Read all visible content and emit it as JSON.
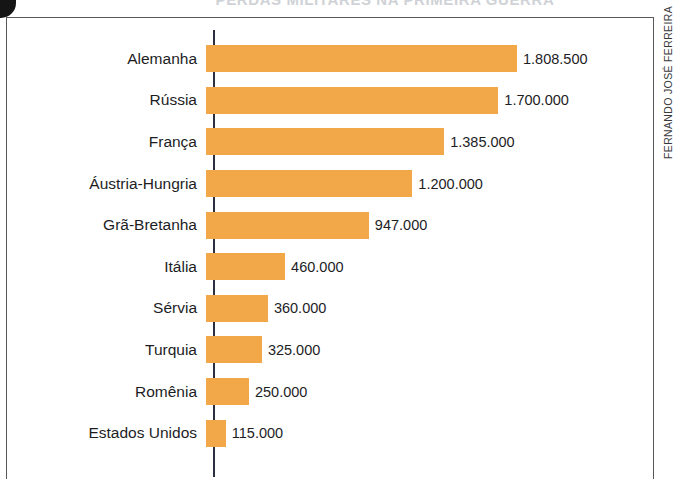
{
  "decorations": {
    "corner_blob": "black-corner-mark",
    "title_sliver": "PERDAS MILITARES NA PRIMEIRA GUERRA",
    "credit": "FERNANDO JOSÉ FERREIRA"
  },
  "chart_data": {
    "type": "bar",
    "orientation": "horizontal",
    "title": "",
    "xlabel": "",
    "ylabel": "",
    "grid": false,
    "legend": false,
    "xlim": [
      0,
      1808500
    ],
    "value_format": "dot-thousands",
    "bar_color": "#f2a848",
    "axis_color": "#2b3040",
    "text_color": "#1d1d1f",
    "categories": [
      "Alemanha",
      "Rússia",
      "França",
      "Áustria-Hungria",
      "Grã-Bretanha",
      "Itália",
      "Sérvia",
      "Turquia",
      "Romênia",
      "Estados Unidos"
    ],
    "values": [
      1808500,
      1700000,
      1385000,
      1200000,
      947000,
      460000,
      360000,
      325000,
      250000,
      115000
    ],
    "value_labels": [
      "1.808.500",
      "1.700.000",
      "1.385.000",
      "1.200.000",
      "947.000",
      "460.000",
      "360.000",
      "325.000",
      "250.000",
      "115.000"
    ]
  }
}
